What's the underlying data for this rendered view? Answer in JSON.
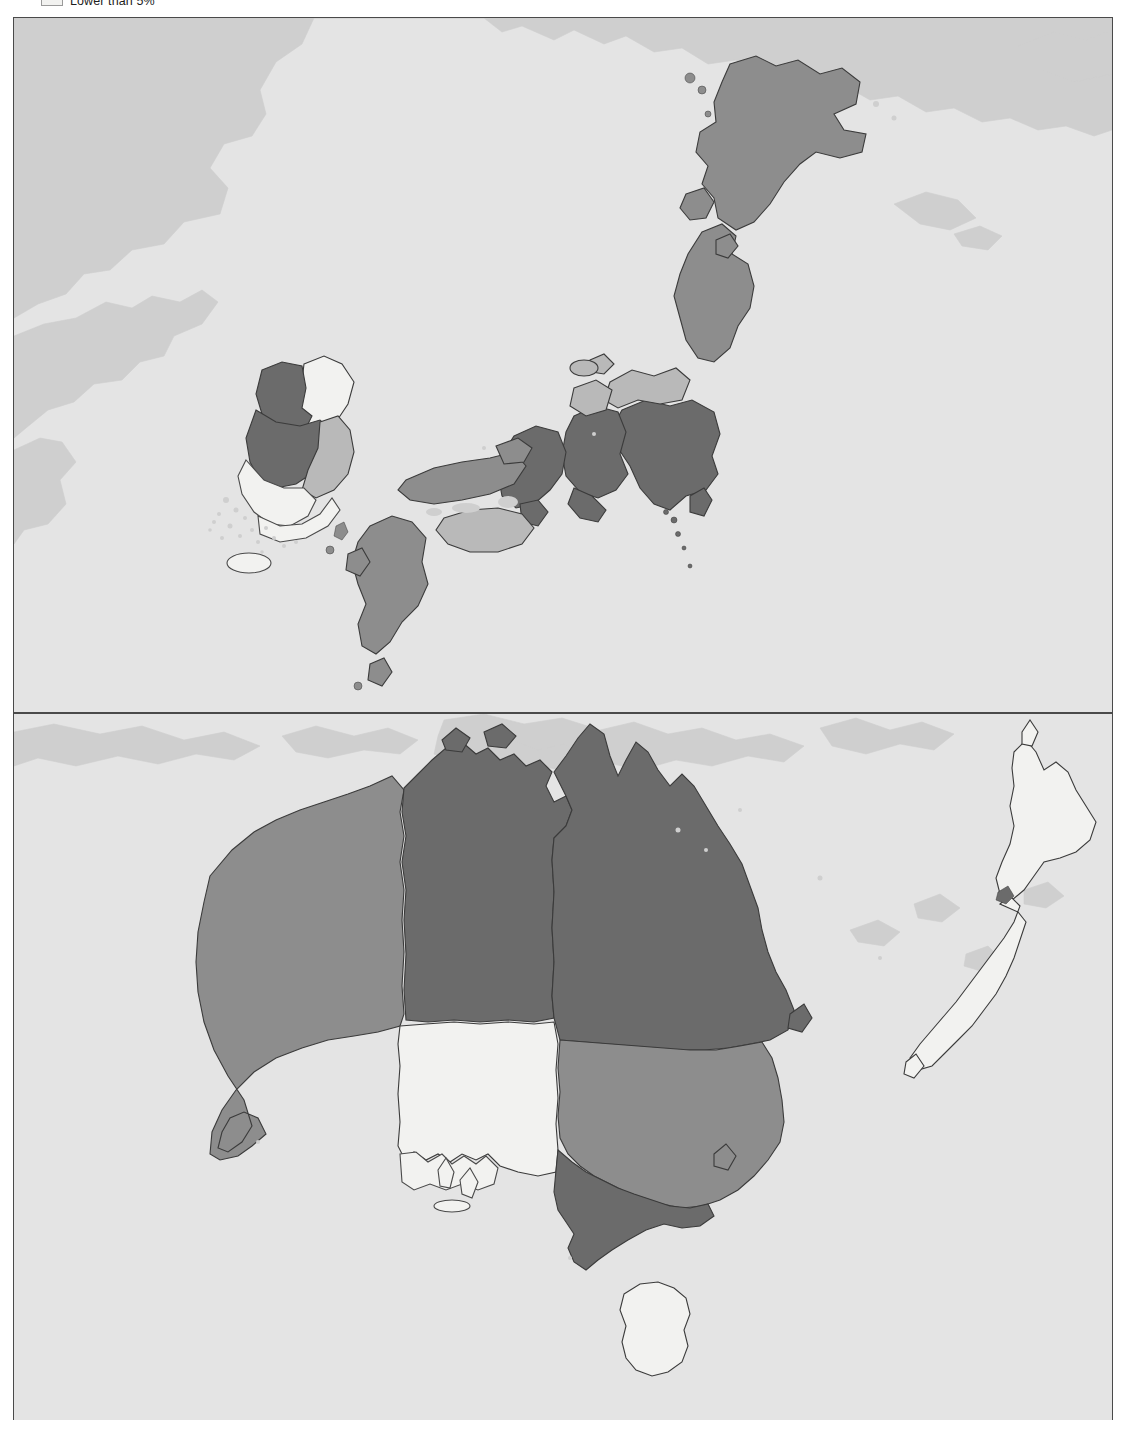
{
  "legend": {
    "items": [
      {
        "label": "Lower than 5%",
        "color": "#f2f2f0",
        "swatch_name": "legend-swatch-lower-than-5"
      }
    ],
    "visible_label": "Lower than 5%"
  },
  "figure": {
    "type": "choropleth-map",
    "panel_count": 2,
    "background_color": "#e4e4e4",
    "border_color": "#4a4a4a",
    "out_of_scope_land_color": "#cfcfcf"
  },
  "classes": [
    {
      "name": "lower-than-5",
      "color": "#f2f2f0"
    },
    {
      "name": "mid",
      "color": "#b9b9b9"
    },
    {
      "name": "high",
      "color": "#8d8d8d"
    },
    {
      "name": "highest",
      "color": "#6b6b6b"
    }
  ],
  "panels": [
    {
      "id": "asia",
      "name": "east-asia-panel",
      "regions": [
        {
          "name": "Hokkaido",
          "class": "high"
        },
        {
          "name": "Tohoku",
          "class": "high"
        },
        {
          "name": "Kanto",
          "class": "highest"
        },
        {
          "name": "Chubu",
          "class": "highest"
        },
        {
          "name": "Hokuriku",
          "class": "mid"
        },
        {
          "name": "Kansai",
          "class": "highest"
        },
        {
          "name": "Chugoku",
          "class": "high"
        },
        {
          "name": "Shikoku",
          "class": "mid"
        },
        {
          "name": "Kyushu",
          "class": "high"
        },
        {
          "name": "Gyeonggi",
          "class": "highest"
        },
        {
          "name": "Chungcheong",
          "class": "highest"
        },
        {
          "name": "Gyeongsang",
          "class": "mid"
        },
        {
          "name": "Jeolla",
          "class": "lower-than-5"
        },
        {
          "name": "Gangwon",
          "class": "lower-than-5"
        },
        {
          "name": "Jeju",
          "class": "lower-than-5"
        }
      ]
    },
    {
      "id": "oceania",
      "name": "oceania-panel",
      "regions": [
        {
          "name": "Western Australia",
          "class": "high"
        },
        {
          "name": "Northern Territory",
          "class": "highest"
        },
        {
          "name": "Queensland",
          "class": "highest"
        },
        {
          "name": "South Australia",
          "class": "lower-than-5"
        },
        {
          "name": "New South Wales",
          "class": "high"
        },
        {
          "name": "Victoria",
          "class": "highest"
        },
        {
          "name": "Tasmania",
          "class": "lower-than-5"
        },
        {
          "name": "New Zealand North Island",
          "class": "lower-than-5"
        },
        {
          "name": "New Zealand South Island",
          "class": "lower-than-5"
        }
      ]
    }
  ]
}
